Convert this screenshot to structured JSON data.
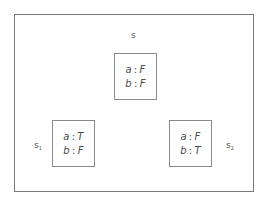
{
  "diagram": {
    "type": "state-assignment-diagram",
    "states": [
      {
        "id": "s",
        "label": "s",
        "subscript": "",
        "assignments": [
          {
            "var": "a",
            "sep": ":",
            "value": "F"
          },
          {
            "var": "b",
            "sep": ":",
            "value": "F"
          }
        ]
      },
      {
        "id": "s1",
        "label": "s",
        "subscript": "1",
        "assignments": [
          {
            "var": "a",
            "sep": ":",
            "value": "T"
          },
          {
            "var": "b",
            "sep": ":",
            "value": "F"
          }
        ]
      },
      {
        "id": "s2",
        "label": "s",
        "subscript": "2",
        "assignments": [
          {
            "var": "a",
            "sep": ":",
            "value": "F"
          },
          {
            "var": "b",
            "sep": ":",
            "value": "T"
          }
        ]
      }
    ]
  },
  "colors": {
    "frame_border": "#7a7a7a",
    "box_border": "#8a8a8a",
    "text": "#4a4a4a",
    "background": "#ffffff"
  }
}
